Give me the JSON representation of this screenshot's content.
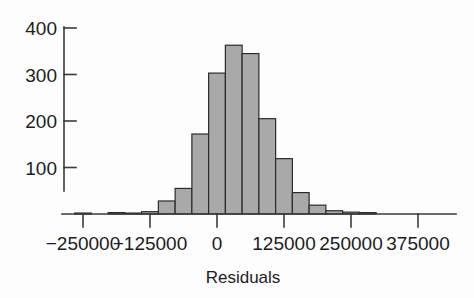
{
  "chart_data": {
    "type": "bar",
    "subtype": "histogram",
    "title": "",
    "xlabel": "Residuals",
    "ylabel": "",
    "xlim": [
      -312500,
      406250
    ],
    "ylim": [
      0,
      420
    ],
    "grid": false,
    "legend": null,
    "bin_width": 31250,
    "x_tick_labels": [
      "-250000",
      "-125000",
      "0",
      "125000",
      "250000",
      "375000"
    ],
    "x_tick_values": [
      -250000,
      -125000,
      0,
      125000,
      250000,
      375000
    ],
    "y_tick_labels": [
      "100",
      "200",
      "300",
      "400"
    ],
    "y_tick_values": [
      100,
      200,
      300,
      400
    ],
    "bin_starts": [
      -296875,
      -265625,
      -234375,
      -203125,
      -171875,
      -140625,
      -109375,
      -78125,
      -46875,
      -15625,
      15625,
      46875,
      78125,
      109375,
      140625,
      171875,
      203125,
      234375,
      265625,
      296875,
      328125
    ],
    "bin_centers": [
      -281250,
      -250000,
      -218750,
      -187500,
      -156250,
      -125000,
      -93750,
      -62500,
      -31250,
      0,
      31250,
      62500,
      93750,
      125000,
      156250,
      187500,
      218750,
      250000,
      281250,
      312500,
      343750
    ],
    "values": [
      0,
      2,
      0,
      3,
      2,
      5,
      28,
      55,
      172,
      303,
      363,
      345,
      205,
      119,
      46,
      19,
      7,
      4,
      3,
      0,
      0
    ],
    "bars": [
      {
        "center": -281250,
        "count": 0
      },
      {
        "center": -250000,
        "count": 2
      },
      {
        "center": -218750,
        "count": 0
      },
      {
        "center": -187500,
        "count": 3
      },
      {
        "center": -156250,
        "count": 2
      },
      {
        "center": -125000,
        "count": 5
      },
      {
        "center": -93750,
        "count": 28
      },
      {
        "center": -62500,
        "count": 55
      },
      {
        "center": -31250,
        "count": 172
      },
      {
        "center": 0,
        "count": 303
      },
      {
        "center": 31250,
        "count": 363
      },
      {
        "center": 62500,
        "count": 345
      },
      {
        "center": 93750,
        "count": 205
      },
      {
        "center": 125000,
        "count": 119
      },
      {
        "center": 156250,
        "count": 46
      },
      {
        "center": 187500,
        "count": 19
      },
      {
        "center": 218750,
        "count": 7
      },
      {
        "center": 250000,
        "count": 4
      },
      {
        "center": 281250,
        "count": 3
      },
      {
        "center": 312500,
        "count": 0
      },
      {
        "center": 343750,
        "count": 0
      }
    ],
    "colors": {
      "bar_fill": "#a9a9a9",
      "bar_stroke": "#2b2b2b",
      "axis": "#3a3a3a",
      "text": "#1c1c1c",
      "background": "#fdfdfd"
    }
  }
}
